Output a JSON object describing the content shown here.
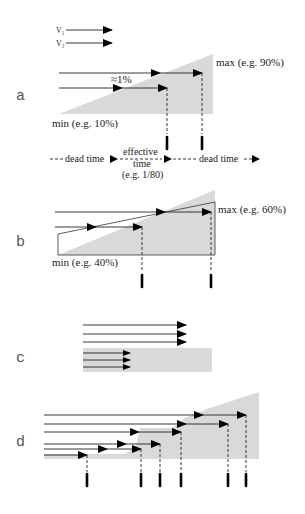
{
  "legend": {
    "items": [
      {
        "label": "V₁"
      },
      {
        "label": "V₂"
      }
    ]
  },
  "panels": {
    "a": {
      "label": "a",
      "max_label": "max (e.g. 90%)",
      "min_label": "min (e.g. 10%)",
      "delta_label": "≈1%",
      "timeline": {
        "dead_time_left": "dead time",
        "effective_line1": "effective",
        "effective_line2": "time",
        "effective_line3": "(e.g. 1/80)",
        "dead_time_right": "dead time"
      }
    },
    "b": {
      "label": "b",
      "max_label": "max (e.g. 60%)",
      "min_label": "min (e.g. 40%)"
    },
    "c": {
      "label": "c"
    },
    "d": {
      "label": "d"
    }
  },
  "colors": {
    "threshold_fill": "#d9d9d9",
    "arrow": "#000000",
    "text": "#222222"
  }
}
